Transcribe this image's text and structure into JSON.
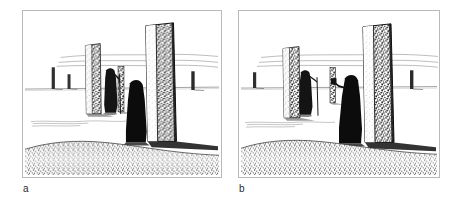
{
  "figure": {
    "kind": "two-panel line-art illustration",
    "background_color": "#ffffff",
    "frame_border_color": "#b9b9b9",
    "ink_color": "#1a1a1a"
  },
  "panels": [
    {
      "id": "a",
      "label": "a",
      "caption_letter": "a",
      "scene": "megalithic stone circle with two robed figures",
      "elements": {
        "foreground_stone": "tall standing stone, right of centre, light left face and dark speckled right face",
        "mid_stone": "tall slim standing stone, left of centre",
        "figure_with_staff": "robed figure holding a long staff, standing beside the mid stone",
        "figure_foreground": "robed hooded figure in silhouette at base of foreground stone",
        "background_stones": "three small distant stones on the horizon",
        "horizon_lines": "faint distant hill lines across upper third",
        "ground_line": "flat ground line across the middle",
        "foreground_bank": "dark stippled bank across the bottom"
      }
    },
    {
      "id": "b",
      "label": "b",
      "caption_letter": "b",
      "scene": "same stone circle, figures repositioned",
      "elements": {
        "foreground_stone": "tall standing stone, right of centre, light left face and dark speckled right face",
        "mid_stone": "tall slim standing stone, left of centre",
        "figure_with_staff": "robed figure holding a long staff beside the mid stone",
        "figure_foreground": "robed hooded figure holding a small raised object, left of the foreground stone",
        "background_stones": "three small distant stones on the horizon",
        "horizon_lines": "faint distant hill lines across upper third",
        "ground_line": "flat ground line across the middle",
        "foreground_bank": "dark stippled bank across the bottom"
      }
    }
  ]
}
